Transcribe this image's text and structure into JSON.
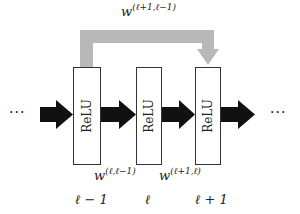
{
  "diagram": {
    "type": "residual-network-layers",
    "layers": [
      {
        "unit_label": "ReLU",
        "index_label": "ℓ − 1"
      },
      {
        "unit_label": "ReLU",
        "index_label": "ℓ"
      },
      {
        "unit_label": "ReLU",
        "index_label": "ℓ + 1"
      }
    ],
    "weights": {
      "w1": {
        "base": "w",
        "sup": "(ℓ,ℓ−1)"
      },
      "w2": {
        "base": "w",
        "sup": "(ℓ+1,ℓ)"
      },
      "skip": {
        "base": "w",
        "sup": "(ℓ+1,ℓ−1)"
      }
    },
    "ellipsis_left": "···",
    "ellipsis_right": "···",
    "colors": {
      "forward_arrow": "#111111",
      "skip_arrow": "#b8b8b8",
      "box_border": "#333333"
    }
  }
}
